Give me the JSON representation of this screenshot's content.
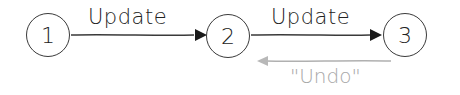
{
  "diagram": {
    "type": "state-transition",
    "nodes": [
      {
        "id": "1",
        "label": "1"
      },
      {
        "id": "2",
        "label": "2"
      },
      {
        "id": "3",
        "label": "3"
      }
    ],
    "edges": [
      {
        "from": "1",
        "to": "2",
        "label": "Update",
        "color": "#333333"
      },
      {
        "from": "2",
        "to": "3",
        "label": "Update",
        "color": "#333333"
      },
      {
        "from": "3",
        "to": "2",
        "label": "\"Undo\"",
        "color": "#a8a8a8"
      }
    ]
  }
}
